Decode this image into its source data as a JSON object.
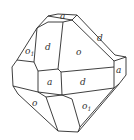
{
  "diagram": {
    "type": "crystal-face-drawing",
    "faces": [
      {
        "id": "top-a",
        "label": "a",
        "x": 63,
        "y": 19
      },
      {
        "id": "upper-left-o1",
        "label": "o",
        "sub": "1",
        "x": 27,
        "y": 55
      },
      {
        "id": "upper-d",
        "label": "d",
        "x": 47,
        "y": 51
      },
      {
        "id": "upper-o",
        "label": "o",
        "x": 77,
        "y": 55
      },
      {
        "id": "upper-right-d",
        "label": "d",
        "x": 98,
        "y": 41
      },
      {
        "id": "right-a",
        "label": "a",
        "x": 116,
        "y": 73
      },
      {
        "id": "center-a",
        "label": "a",
        "x": 48,
        "y": 84
      },
      {
        "id": "center-d",
        "label": "d",
        "x": 81,
        "y": 84
      },
      {
        "id": "lower-left-o",
        "label": "o",
        "x": 34,
        "y": 105
      },
      {
        "id": "lower-right-o1",
        "label": "o",
        "sub": "1",
        "x": 83,
        "y": 109
      }
    ]
  }
}
